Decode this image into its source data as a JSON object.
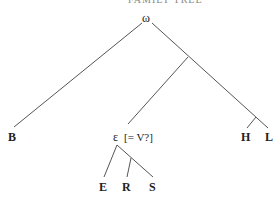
{
  "header": {
    "text": "FAMILY TREE"
  },
  "tree": {
    "root": {
      "label": "ω"
    },
    "nodes": {
      "B": {
        "label": "B"
      },
      "epsilon": {
        "label": "ε",
        "annotation": "[= V?]"
      },
      "H": {
        "label": "H"
      },
      "L": {
        "label": "L"
      },
      "E": {
        "label": "E"
      },
      "R": {
        "label": "R"
      },
      "S": {
        "label": "S"
      }
    },
    "edges": [
      [
        "ω",
        "B"
      ],
      [
        "ω",
        "L"
      ],
      [
        "junction1",
        "ε"
      ],
      [
        "junction2",
        "H"
      ],
      [
        "ε",
        "E"
      ],
      [
        "ε",
        "S"
      ],
      [
        "junction3",
        "R"
      ]
    ]
  }
}
